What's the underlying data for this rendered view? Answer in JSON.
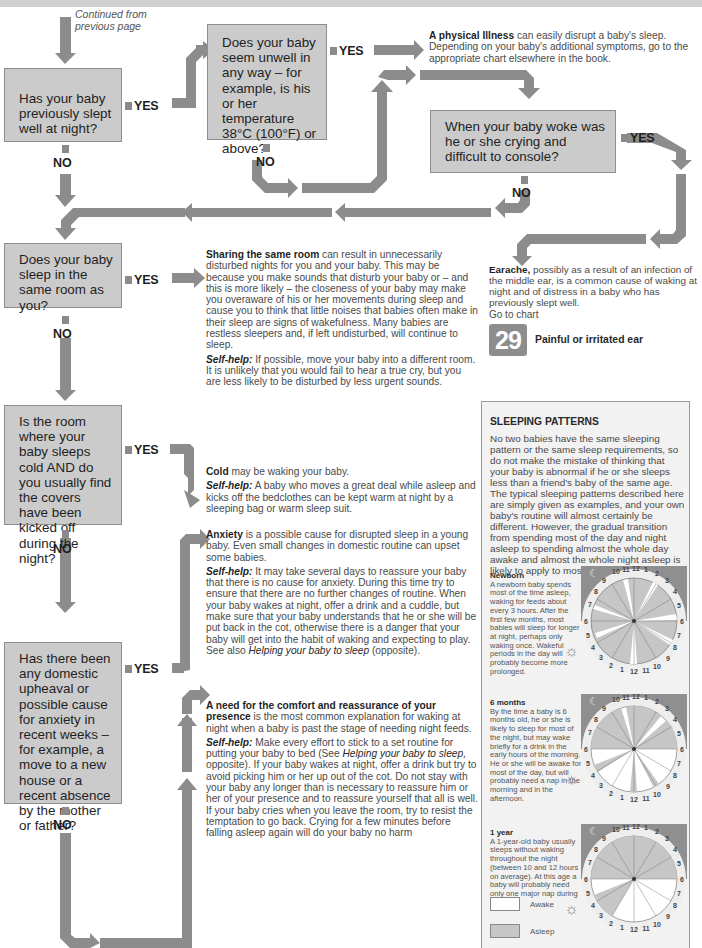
{
  "page": {
    "continued": [
      "Continued from",
      "previous page"
    ],
    "yes_label": "YES",
    "no_label": "NO"
  },
  "questions": [
    {
      "id": "q1",
      "text": "Has your baby previously slept well at night?"
    },
    {
      "id": "q2",
      "text": "Does your baby seem unwell in any way – for example, is his or her temperature 38°C (100°F) or above?"
    },
    {
      "id": "q3",
      "text": "When your baby woke was he or she crying and difficult to console?"
    },
    {
      "id": "q4",
      "text": "Does your baby sleep in the same room as you?"
    },
    {
      "id": "q5",
      "text": "Is the room where your baby sleeps cold AND do you usually find the covers have been kicked off during the night?"
    },
    {
      "id": "q6",
      "text": "Has there been any domestic upheaval or possible cause for anxiety in recent weeks – for example, a move to a new house or a recent absence by the mother or father?"
    }
  ],
  "outcomes": {
    "illness": {
      "bold": "A physical Illness",
      "text": " can easily disrupt a baby's sleep. Depending on your baby's additional symptoms, go to the appropriate chart elsewhere in the book."
    },
    "earache": {
      "bold": "Earache,",
      "text": " possibly as a result of an infection of the middle ear, is a common cause of waking at night and of distress in a baby who has previously slept well."
    },
    "goto_chart": "Go to chart",
    "chart_number": "29",
    "chart_title": "Painful or irritated ear",
    "sharing": {
      "bold": "Sharing the same room",
      "text": " can result in unnecessarily disturbed nights for you and your baby. This may be because you make sounds that disturb your baby or – and this is more likely – the closeness of your baby may make you overaware of his or her movements during sleep and cause you to think that little noises that babies often make in their sleep are signs of wakefulness. Many babies are restless sleepers and, if left undisturbed, will continue to sleep.",
      "selfhelp_label": "Self-help:",
      "selfhelp": " If possible, move your baby into a different room. It is unlikely that you would fail to hear a true cry, but you are less likely to be disturbed by less urgent sounds."
    },
    "cold": {
      "bold": "Cold",
      "text": " may be waking your baby.",
      "selfhelp_label": "Self-help:",
      "selfhelp": " A baby who moves a great deal while asleep and kicks off the bedclothes can be kept warm at night by a sleeping bag or warm sleep suit."
    },
    "anxiety": {
      "bold": "Anxiety",
      "text": " is a possible cause for disrupted sleep in a young baby. Even small changes in domestic routine can upset some babies.",
      "selfhelp_label": "Self-help:",
      "selfhelp": " It may take several days to reassure your baby that there is no cause for anxiety. During this time try to ensure that there are no further changes of routine. When your baby wakes at night, offer a drink and a cuddle, but make sure that your baby understands that he or she will be put back in the cot, otherwise there is a danger that your baby will get into the habit of waking and expecting to play. See also ",
      "selfhelp_link": "Helping your baby to sleep",
      "selfhelp_end": " (opposite)."
    },
    "comfort": {
      "bold": "A need for the comfort and reassurance of your presence",
      "text": " is the most common explanation for waking at night when a baby is past the stage of needing night feeds.",
      "selfhelp_label": "Self-help:",
      "selfhelp": " Make every effort to stick to a set routine for putting your baby to bed (See ",
      "selfhelp_link": "Helping your baby to sleep,",
      "selfhelp_end": " opposite). If your baby wakes at night, offer a drink but try to avoid picking him or her up out of the cot. Do not stay with your baby any longer than is necessary to reassure him or her of your presence and to reassure yourself that all is well. If your baby cries when you leave the room, try to resist the temptation to go back. Crying for a few minutes before falling asleep again will do your baby no harm"
    }
  },
  "sleeping_patterns": {
    "title": "SLEEPING PATTERNS",
    "intro": "No two babies have the same sleeping pattern or the same sleep requirements, so do not make the mistake of thinking that your baby is abnormal if he or she sleeps less than a friend's baby of the same age. The typical sleeping patterns described here are simply given as examples, and your own baby's routine will almost certainly be different. However, the gradual transition from spending most of the day and night asleep to spending almost the whole day awake and almost the whole night asleep is likely to apply to most babies.",
    "patterns": [
      {
        "heading": "Newborn",
        "text": "A newborn baby spends most of the time asleep, waking for feeds about every 3 hours. After the first few months, most babies will sleep for longer at night, perhaps only waking once. Wakeful periods in the day will probably become more prolonged."
      },
      {
        "heading": "6 months",
        "text": "By the time a baby is 6 months old, he or she is likely to sleep for most of the night, but may wake briefly for a drink in the early hours of the morning. He or she will be awake for most of the day, but will probably need a nap in the morning and in the afternoon."
      },
      {
        "heading": "1 year",
        "text": "A 1-year-old baby usually sleeps without waking throughout the night (between 10 and 12 hours on average). At this age a baby will probably need only one major nap during the day."
      }
    ],
    "legend": [
      {
        "label": "Awake",
        "color": "#ffffff"
      },
      {
        "label": "Asleep",
        "color": "#c6c6c6"
      }
    ],
    "clock_top_labels": [
      "6",
      "7",
      "8",
      "9",
      "10",
      "11",
      "12",
      "1",
      "2",
      "3",
      "4",
      "5",
      "6"
    ],
    "clock_bottom_labels": [
      "5",
      "4",
      "3",
      "2",
      "1",
      "12",
      "11",
      "10",
      "9",
      "8",
      "7"
    ]
  },
  "colors": {
    "box_fill": "#cbcbcb",
    "arrow": "#8c8c8c",
    "asleep": "#c6c6c6",
    "awake": "#ffffff",
    "night_band": "#8f8f8f"
  }
}
